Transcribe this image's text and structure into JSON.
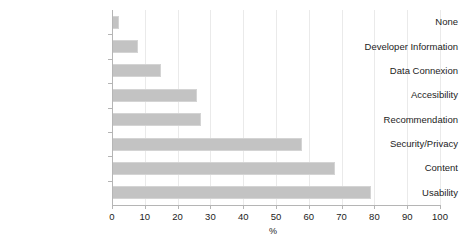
{
  "chart_data": {
    "type": "bar",
    "orientation": "horizontal",
    "title": "",
    "xlabel": "%",
    "ylabel": "",
    "xlim": [
      0,
      100
    ],
    "xticks": [
      0,
      10,
      20,
      30,
      40,
      50,
      60,
      70,
      80,
      90,
      100
    ],
    "xtick_labels": [
      "0",
      "10",
      "20",
      "30",
      "40",
      "50",
      "60",
      "70",
      "80",
      "90",
      "100"
    ],
    "grid": true,
    "legend": false,
    "bar_color": "#c3c3c3",
    "categories": [
      "None",
      "Developer Information",
      "Data Connexion",
      "Accesibility",
      "Recommendation",
      "Security/Privacy",
      "Content",
      "Usability"
    ],
    "values": [
      2,
      8,
      15,
      26,
      27,
      58,
      68,
      79
    ]
  }
}
